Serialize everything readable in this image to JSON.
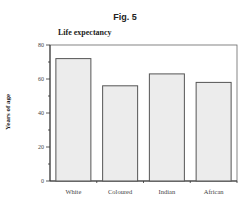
{
  "figure_label": "Fig. 5",
  "chart_data": {
    "type": "bar",
    "title": "Life expectancy",
    "xlabel": "",
    "ylabel": "Years of age",
    "categories": [
      "White",
      "Coloured",
      "Indian",
      "African"
    ],
    "values": [
      72,
      56,
      63,
      58
    ],
    "ylim": [
      0,
      80
    ],
    "yticks": [
      0,
      20,
      40,
      60,
      80
    ],
    "grid": false,
    "legend": null,
    "colors": {
      "bar_fill": "#ececec",
      "bar_stroke": "#555555",
      "axis": "#333333"
    }
  }
}
